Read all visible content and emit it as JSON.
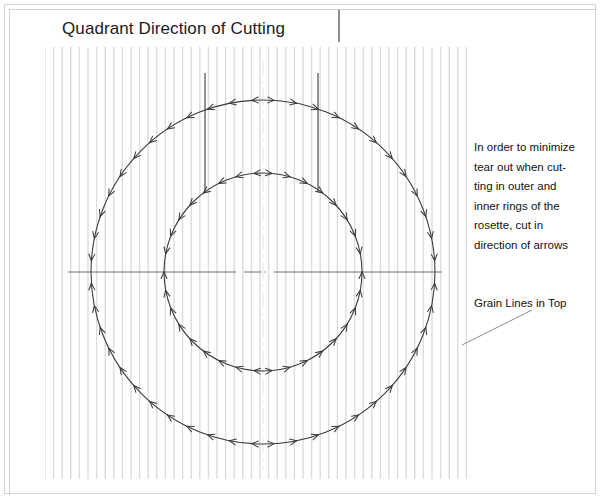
{
  "document": {
    "title": "Quadrant Direction of Cutting"
  },
  "annotations": {
    "instruction": "In order to minimize\ntear out when cut-\nting in outer and\ninner rings of the\nrosette, cut in\ndirection of arrows",
    "grain_label": "Grain Lines in Top"
  },
  "icons": {
    "arrow": "arrowhead-icon",
    "grain_line": "grain-line-icon",
    "center_mark": "centerline-icon"
  },
  "colors": {
    "ink": "#1b1b1b",
    "ring_stroke": "#3c3c3c",
    "grain_line": "#dcdcdc",
    "centerline": "#6e6e6e",
    "frame": "#d4d4d4",
    "leader": "#8a8a8a"
  },
  "diagram": {
    "type": "technical-drawing",
    "center": {
      "x": 263,
      "y": 272
    },
    "outer_ring": {
      "radius": 172,
      "arrow_count": 48,
      "direction": "away from vertical centerline"
    },
    "inner_ring": {
      "radius": 99,
      "arrow_count": 34,
      "direction": "away from vertical centerline"
    },
    "grain_field": {
      "left": 45,
      "right": 467,
      "top": 47,
      "bottom": 479,
      "spacing": 8.6
    },
    "quadrant_lines": [
      {
        "x": 205,
        "y_top": 73,
        "y_bottom": 192
      },
      {
        "x": 318,
        "y_top": 73,
        "y_bottom": 192
      }
    ],
    "leader_line": {
      "x1": 532,
      "y1": 310,
      "x2": 462,
      "y2": 345
    }
  }
}
